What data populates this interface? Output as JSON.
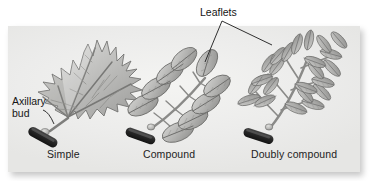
{
  "figure": {
    "kind": "botanical-diagram",
    "background_color": "#ffffff",
    "panel_color": "#efefed"
  },
  "labels": {
    "leaflets": "Leaflets",
    "axillary_bud_line1": "Axillary",
    "axillary_bud_line2": "bud"
  },
  "captions": {
    "simple": "Simple",
    "compound": "Compound",
    "doubly_compound": "Doubly compound"
  },
  "colors": {
    "leaf_light": "#d8d8d6",
    "leaf_mid": "#b4b4b2",
    "leaf_dark": "#8a8a88",
    "vein": "#6f6f6d",
    "outline": "#5a5a58",
    "stem_dark": "#2b2b2b",
    "leader_line": "#1a1a1a",
    "text": "#1a1a1a"
  }
}
